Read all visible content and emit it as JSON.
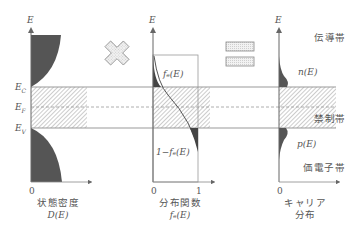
{
  "diagram": {
    "operators": {
      "multiply": "multiply-cross",
      "equals": "equals-sign"
    },
    "energy_levels": {
      "Ec": {
        "label": "E",
        "sub": "C"
      },
      "Ef": {
        "label": "E",
        "sub": "F"
      },
      "Ev": {
        "label": "E",
        "sub": "V"
      }
    },
    "panels": [
      {
        "axis_label": "E",
        "origin_tick": "0",
        "title": "状態密度",
        "subtitle": "D(E)"
      },
      {
        "axis_label": "E",
        "origin_tick": "0",
        "end_tick": "1",
        "curve_label_upper": "fₑ(E)",
        "curve_label_lower": "1−fₑ(E)",
        "title": "分布関数",
        "subtitle": "fₑ(E)"
      },
      {
        "axis_label": "E",
        "origin_tick": "0",
        "curve_label_upper": "n(E)",
        "curve_label_lower": "p(E)",
        "title": "キャリア",
        "subtitle": "分布"
      }
    ],
    "band_labels": {
      "conduction": "伝導帯",
      "forbidden": "禁制帯",
      "valence": "価電子帯"
    },
    "colors": {
      "fill_dark": "#555555",
      "line": "#888888",
      "hatch": "#999999",
      "operator_fill": "#e6e6e6"
    }
  }
}
